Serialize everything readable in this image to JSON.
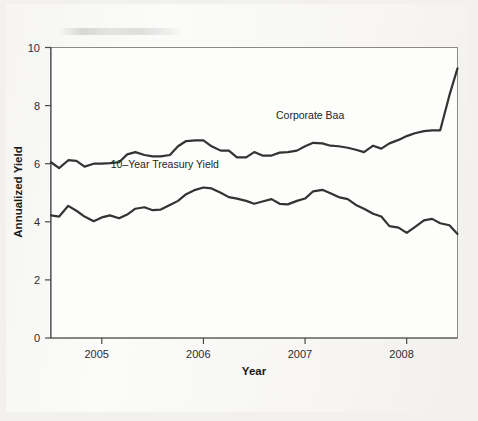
{
  "figure": {
    "background_color": "#f2f1ef",
    "paper_color": "#fbfbfa",
    "line_color": "#333333"
  },
  "chart_data": {
    "type": "line",
    "title": "",
    "xlabel": "Year",
    "ylabel": "Annualized Yield",
    "ylim": [
      0,
      10
    ],
    "yticks": [
      0,
      2,
      4,
      6,
      8,
      10
    ],
    "ytick_labels": [
      "0",
      "2",
      "4",
      "6",
      "8",
      "10"
    ],
    "xlim": [
      2004.5,
      2008.5
    ],
    "xticks": [
      2005.0,
      2006.0,
      2007.0,
      2008.0
    ],
    "xtick_labels": [
      "2005",
      "2006",
      "2007",
      "2008"
    ],
    "xtick_label_positions": [
      2004.95,
      2005.95,
      2006.95,
      2007.95
    ],
    "grid": false,
    "legend_position": "inline-annotations",
    "annotations": [
      {
        "text": "Corporate Baa",
        "x": 2007.05,
        "y": 7.55
      },
      {
        "text": "10–Year Treasury Yield",
        "x": 2005.62,
        "y": 5.85
      }
    ],
    "x": [
      2004.5,
      2004.58,
      2004.67,
      2004.75,
      2004.83,
      2004.92,
      2005.0,
      2005.08,
      2005.17,
      2005.25,
      2005.33,
      2005.42,
      2005.5,
      2005.58,
      2005.67,
      2005.75,
      2005.83,
      2005.92,
      2006.0,
      2006.08,
      2006.17,
      2006.25,
      2006.33,
      2006.42,
      2006.5,
      2006.58,
      2006.67,
      2006.75,
      2006.83,
      2006.92,
      2007.0,
      2007.08,
      2007.17,
      2007.25,
      2007.33,
      2007.42,
      2007.5,
      2007.58,
      2007.67,
      2007.75,
      2007.83,
      2007.92,
      2008.0,
      2008.08,
      2008.17,
      2008.25,
      2008.33,
      2008.42,
      2008.5
    ],
    "series": [
      {
        "name": "Corporate Baa",
        "values": [
          6.05,
          5.85,
          6.12,
          6.1,
          5.9,
          6.0,
          6.0,
          6.02,
          6.05,
          6.32,
          6.4,
          6.3,
          6.25,
          6.25,
          6.3,
          6.6,
          6.78,
          6.8,
          6.8,
          6.6,
          6.45,
          6.45,
          6.22,
          6.22,
          6.4,
          6.28,
          6.28,
          6.38,
          6.4,
          6.45,
          6.6,
          6.72,
          6.7,
          6.62,
          6.6,
          6.55,
          6.48,
          6.4,
          6.62,
          6.52,
          6.7,
          6.82,
          6.95,
          7.05,
          7.12,
          7.15,
          7.15,
          8.35,
          9.28
        ]
      },
      {
        "name": "10–Year Treasury Yield",
        "values": [
          4.22,
          4.18,
          4.55,
          4.38,
          4.18,
          4.02,
          4.15,
          4.22,
          4.12,
          4.25,
          4.45,
          4.5,
          4.4,
          4.42,
          4.58,
          4.72,
          4.95,
          5.1,
          5.18,
          5.15,
          5.0,
          4.85,
          4.8,
          4.72,
          4.62,
          4.7,
          4.78,
          4.62,
          4.6,
          4.72,
          4.8,
          5.05,
          5.1,
          4.98,
          4.85,
          4.78,
          4.58,
          4.45,
          4.28,
          4.18,
          3.85,
          3.8,
          3.62,
          3.82,
          4.05,
          4.1,
          3.95,
          3.88,
          3.58
        ]
      }
    ]
  },
  "axis": {
    "y_title": "Annualized Yield",
    "x_title": "Year"
  }
}
